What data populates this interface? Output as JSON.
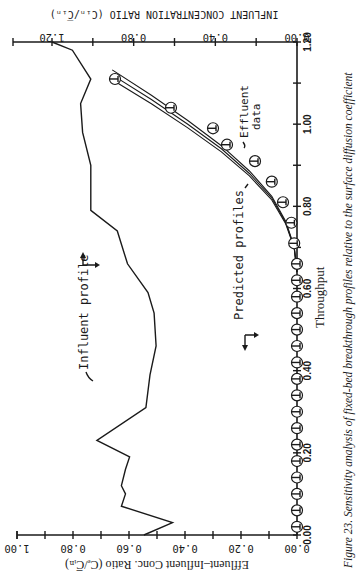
{
  "caption": "Figure 23. Sensitivity analysis of fixed-bed breakthrough profiles relative to the surface diffusion coefficient",
  "axes": {
    "x_label": "Throughput",
    "y_left_label": "Effluent–Influent Conc. Ratio (Cₑ/C̅ᵢₙ)",
    "y_right_label": "INFLUENT CONCENTRATION RATIO (Cᵢₙ/C̅ᵢₙ)",
    "x_ticks": [
      "0.00",
      "0.20",
      "0.40",
      "0.60",
      "0.80",
      "1.00",
      "1.20"
    ],
    "y_left_ticks": [
      "0.00",
      "0.20",
      "0.40",
      "0.60",
      "0.80",
      "1.00"
    ],
    "y_right_ticks": [
      "0.00",
      "0.40",
      "0.80",
      "1.20"
    ]
  },
  "annotations": {
    "influent": "Influent profile",
    "predicted": "Predicted profiles",
    "effluent_1": "Effluent",
    "effluent_2": "data"
  },
  "chart_data": {
    "type": "line",
    "title": "",
    "caption": "Figure 23. Sensitivity analysis of fixed-bed breakthrough profiles relative to the surface diffusion coefficient",
    "xlabel": "Throughput",
    "ylabel": "Effluent-Influent Conc. Ratio (Ce/C̅in)",
    "y2label": "INFLUENT CONCENTRATION RATIO (Cin/C̅in)",
    "xlim": [
      0,
      1.2
    ],
    "ylim": [
      0,
      1.0
    ],
    "y2lim": [
      0,
      1.2
    ],
    "grid": false,
    "orientation": "figure rotated 90 degrees clockwise on page",
    "series": [
      {
        "name": "Effluent data",
        "style": "scatter (circle with tick marker)",
        "axis": "left",
        "x": [
          0.02,
          0.06,
          0.1,
          0.14,
          0.18,
          0.22,
          0.26,
          0.3,
          0.34,
          0.38,
          0.42,
          0.46,
          0.5,
          0.54,
          0.58,
          0.62,
          0.66,
          0.71,
          0.76,
          0.81,
          0.86,
          0.91,
          0.95,
          0.99,
          1.04,
          1.11
        ],
        "y": [
          0.0,
          0.0,
          0.0,
          0.0,
          0.0,
          0.0,
          0.0,
          0.0,
          0.0,
          0.0,
          0.0,
          0.0,
          0.0,
          0.0,
          0.0,
          0.0,
          0.0,
          0.01,
          0.02,
          0.05,
          0.09,
          0.15,
          0.25,
          0.3,
          0.45,
          0.65
        ]
      },
      {
        "name": "Predicted profiles (3 curves)",
        "style": "line",
        "axis": "left",
        "x": [
          0.64,
          0.7,
          0.76,
          0.82,
          0.88,
          0.94,
          1.0,
          1.06,
          1.12
        ],
        "y": [
          0.0,
          0.01,
          0.04,
          0.09,
          0.17,
          0.27,
          0.39,
          0.52,
          0.66
        ]
      },
      {
        "name": "Influent profile",
        "style": "line",
        "axis": "right",
        "x": [
          0.0,
          0.03,
          0.07,
          0.1,
          0.12,
          0.16,
          0.19,
          0.23,
          0.31,
          0.39,
          0.46,
          0.54,
          0.59,
          0.66,
          0.74,
          0.79,
          0.9,
          0.98,
          1.05,
          1.11,
          1.18,
          1.2
        ],
        "y": [
          0.75,
          0.61,
          0.86,
          0.84,
          0.86,
          0.84,
          0.82,
          0.98,
          0.74,
          0.72,
          0.69,
          0.7,
          0.73,
          0.83,
          0.88,
          1.01,
          1.01,
          1.05,
          1.06,
          1.01,
          1.1,
          1.2
        ]
      }
    ]
  }
}
